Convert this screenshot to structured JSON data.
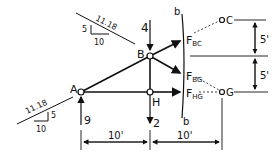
{
  "diagram": {
    "type": "truss free-body (method of sections)",
    "nodes": {
      "A": "A",
      "B": "B",
      "H": "H",
      "C": "C",
      "G": "G"
    },
    "loads": {
      "B": "4",
      "H": "2",
      "A_reaction": "9"
    },
    "forces": {
      "BC": {
        "main": "F",
        "sub": "BC"
      },
      "BG": {
        "main": "F",
        "sub": "BG"
      },
      "HG": {
        "main": "F",
        "sub": "HG"
      }
    },
    "section_labels": {
      "top": "b",
      "bottom": "b"
    },
    "slope_top": {
      "hyp": "11.18",
      "rise": "5",
      "run": "10"
    },
    "slope_bottom": {
      "hyp": "11.18",
      "rise": "5",
      "run": "10"
    },
    "dimensions": {
      "h_left": "10'",
      "h_right": "10'",
      "v_top": "5'",
      "v_bottom": "5'"
    }
  }
}
